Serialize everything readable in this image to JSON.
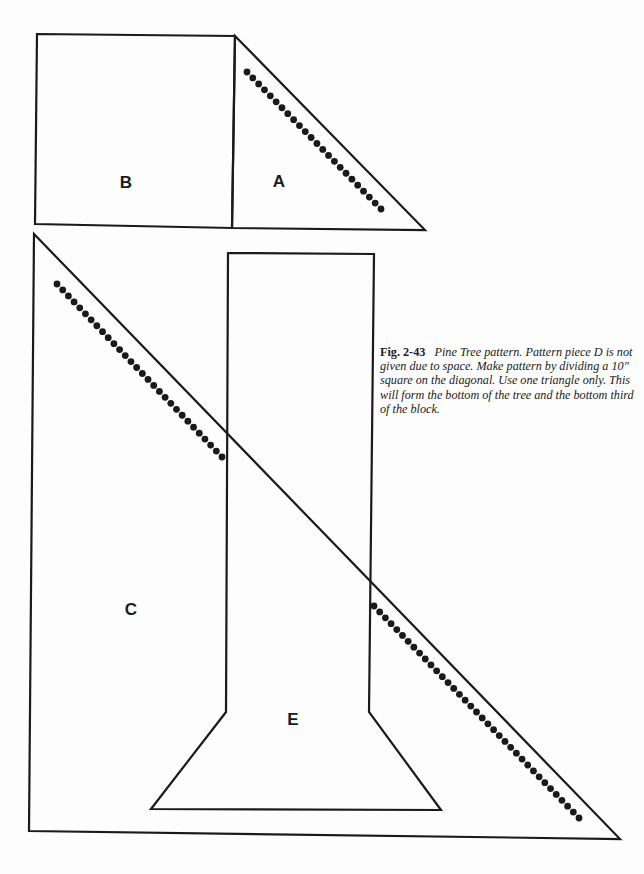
{
  "figure": {
    "number": "Fig. 2-43",
    "caption": "Pine Tree pattern. Pattern piece D is not given due to space. Make pattern by dividing a 10\" square on the diagonal. Use one triangle only. This will form the bottom of the tree and the bottom third of the block."
  },
  "pieces": {
    "B": {
      "label": "B",
      "shape": "square",
      "points": [
        [
          37,
          34
        ],
        [
          235,
          36
        ],
        [
          232,
          228
        ],
        [
          35,
          224
        ]
      ]
    },
    "A": {
      "label": "A",
      "shape": "triangle",
      "points": [
        [
          235,
          36
        ],
        [
          425,
          230
        ],
        [
          232,
          228
        ]
      ],
      "seam_dots": {
        "from": [
          247,
          72
        ],
        "to": [
          381,
          209
        ],
        "count": 24
      }
    },
    "C": {
      "label": "C",
      "shape": "triangle",
      "points": [
        [
          34,
          234
        ],
        [
          620,
          839
        ],
        [
          29,
          831
        ]
      ],
      "seam_dots": [
        {
          "from": [
            57,
            284
          ],
          "to": [
            222,
            457
          ],
          "count": 30
        },
        {
          "from": [
            374,
            606
          ],
          "to": [
            579,
            818
          ],
          "count": 37
        }
      ]
    },
    "E": {
      "label": "E",
      "shape": "trunk",
      "points": [
        [
          228,
          253
        ],
        [
          374,
          254
        ],
        [
          369,
          712
        ],
        [
          441,
          810
        ],
        [
          151,
          809
        ],
        [
          226,
          712
        ]
      ]
    }
  },
  "colors": {
    "line": "#1a1a1a",
    "dots": "#1a1a1a",
    "paper": "#fdfdfd"
  }
}
